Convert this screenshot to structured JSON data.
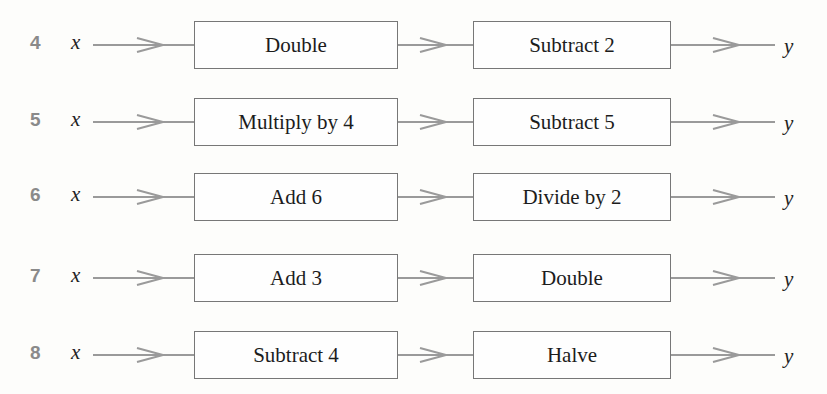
{
  "diagram": {
    "type": "function-machine-chains",
    "input_label": "x",
    "output_label": "y",
    "rows": [
      {
        "number": "4",
        "step1": "Double",
        "step2": "Subtract 2"
      },
      {
        "number": "5",
        "step1": "Multiply by 4",
        "step2": "Subtract 5"
      },
      {
        "number": "6",
        "step1": "Add 6",
        "step2": "Divide by 2"
      },
      {
        "number": "7",
        "step1": "Add 3",
        "step2": "Double"
      },
      {
        "number": "8",
        "step1": "Subtract 4",
        "step2": "Halve"
      }
    ],
    "colors": {
      "number": "#8a8a8a",
      "line": "#9a9a9a",
      "box_border": "#777777",
      "text": "#1e1e1e"
    }
  }
}
